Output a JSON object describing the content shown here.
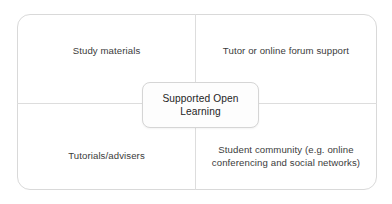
{
  "diagram": {
    "type": "concept-map",
    "title": "Supported Open Learning",
    "center_node": {
      "label": "Supported Open\nLearning"
    },
    "quadrants": [
      {
        "position": "top-left",
        "label": "Study materials"
      },
      {
        "position": "top-right",
        "label": "Tutor or online forum support"
      },
      {
        "position": "bottom-left",
        "label": "Tutorials/advisers"
      },
      {
        "position": "bottom-right",
        "label": "Student community (e.g. online\nconferencing and social networks)"
      }
    ],
    "colors": {
      "frame_border": "#d9d9d9",
      "divider": "#dddddd",
      "label_text": "#3b3b3b",
      "center_text": "#252525",
      "center_border": "#d5d5d5",
      "background": "#ffffff"
    }
  }
}
